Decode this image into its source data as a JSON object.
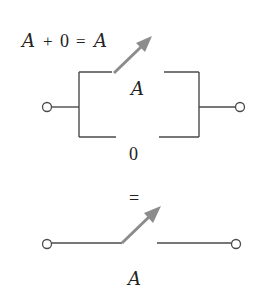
{
  "diagram": {
    "title": "A + 0 = A",
    "title_parts": {
      "a1": "A",
      "plus": "+",
      "zero": "0",
      "eq": "=",
      "a2": "A"
    },
    "parallel_circuit": {
      "top_branch_label": "A",
      "bottom_branch_label": "0",
      "top_switch_state": "open",
      "bottom_branch_state": "open"
    },
    "equals_symbol": "=",
    "single_switch": {
      "label": "A",
      "state": "open"
    },
    "colors": {
      "wire": "#4a4a4a",
      "switch_arrow": "#8c8c8c",
      "text": "#222222",
      "background": "#ffffff"
    }
  }
}
